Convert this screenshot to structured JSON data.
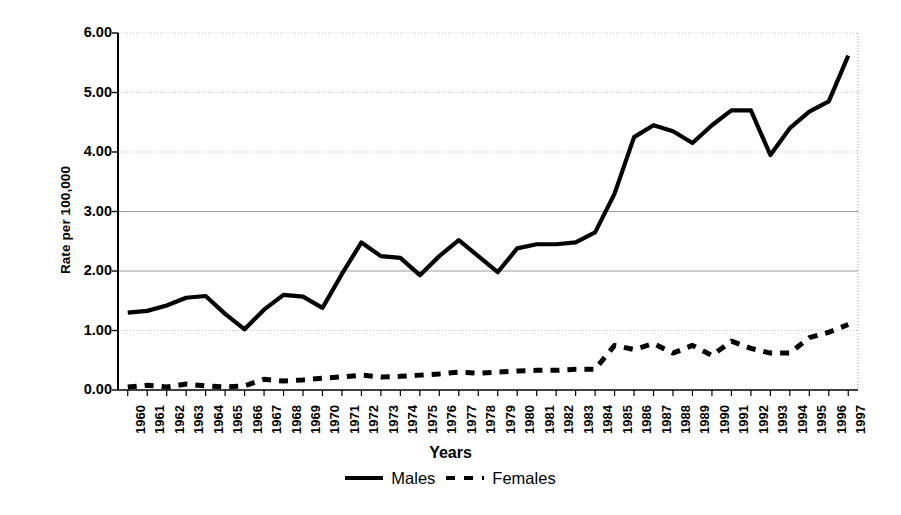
{
  "chart_data": {
    "type": "line",
    "title": "",
    "xlabel": "Years",
    "ylabel": "Rate per 100,000",
    "ylim": [
      0.0,
      6.0
    ],
    "ytick_step": 1.0,
    "ytick_labels": [
      "0.00",
      "1.00",
      "2.00",
      "3.00",
      "4.00",
      "5.00",
      "6.00"
    ],
    "grid": "horizontal",
    "legend_position": "bottom",
    "categories": [
      "1960",
      "1961",
      "1962",
      "1963",
      "1964",
      "1965",
      "1966",
      "1967",
      "1968",
      "1969",
      "1970",
      "1971",
      "1972",
      "1973",
      "1974",
      "1975",
      "1976",
      "1977",
      "1978",
      "1979",
      "1980",
      "1981",
      "1982",
      "1983",
      "1984",
      "1985",
      "1986",
      "1987",
      "1988",
      "1989",
      "1990",
      "1991",
      "1992",
      "1993",
      "1994",
      "1995",
      "1996",
      "1997"
    ],
    "series": [
      {
        "name": "Males",
        "style": "solid",
        "values": [
          1.3,
          1.33,
          1.42,
          1.55,
          1.58,
          1.28,
          1.02,
          1.35,
          1.6,
          1.57,
          1.38,
          1.95,
          2.48,
          2.25,
          2.22,
          1.93,
          2.25,
          2.52,
          2.25,
          1.98,
          2.38,
          2.45,
          2.45,
          2.48,
          2.65,
          3.3,
          4.25,
          4.45,
          4.35,
          4.15,
          4.45,
          4.7,
          4.7,
          3.95,
          4.4,
          4.68,
          4.85,
          5.62
        ]
      },
      {
        "name": "Females",
        "style": "dashed",
        "values": [
          0.05,
          0.08,
          0.05,
          0.1,
          0.07,
          0.05,
          0.07,
          0.18,
          0.15,
          0.17,
          0.2,
          0.22,
          0.25,
          0.22,
          0.23,
          0.25,
          0.27,
          0.3,
          0.28,
          0.3,
          0.32,
          0.33,
          0.33,
          0.35,
          0.35,
          0.75,
          0.68,
          0.78,
          0.62,
          0.75,
          0.58,
          0.82,
          0.7,
          0.62,
          0.62,
          0.88,
          0.97,
          1.1
        ]
      }
    ]
  },
  "axis": {
    "x_title": "Years"
  },
  "legend": {
    "items": [
      {
        "label": "Males",
        "swatch": "solid-line-swatch"
      },
      {
        "label": "Females",
        "swatch": "dashed-line-swatch"
      }
    ]
  }
}
